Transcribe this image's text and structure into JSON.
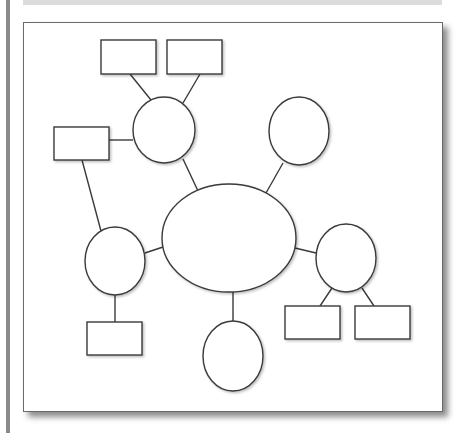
{
  "diagram": {
    "type": "mind-map",
    "colors": {
      "stroke": "#3a3a3a",
      "fill": "#ffffff",
      "frame_border": "#6a6a6a",
      "left_bar": "#8a8a8a",
      "top_band": "#dcdcdc"
    },
    "ellipses": [
      {
        "id": "center",
        "cx": 229,
        "cy": 238,
        "rx": 67,
        "ry": 54
      },
      {
        "id": "circle-top-left",
        "cx": 164,
        "cy": 130,
        "rx": 31,
        "ry": 33
      },
      {
        "id": "circle-top-right",
        "cx": 299,
        "cy": 131,
        "rx": 30,
        "ry": 34
      },
      {
        "id": "circle-left",
        "cx": 115,
        "cy": 261,
        "rx": 30,
        "ry": 34
      },
      {
        "id": "circle-right",
        "cx": 346,
        "cy": 258,
        "rx": 30,
        "ry": 34
      },
      {
        "id": "circle-bottom",
        "cx": 233,
        "cy": 356,
        "rx": 30,
        "ry": 35
      }
    ],
    "rects": [
      {
        "id": "box-top-1",
        "x": 101,
        "y": 40,
        "w": 55,
        "h": 34
      },
      {
        "id": "box-top-2",
        "x": 167,
        "y": 40,
        "w": 55,
        "h": 34
      },
      {
        "id": "box-left",
        "x": 54,
        "y": 127,
        "w": 55,
        "h": 33
      },
      {
        "id": "box-bottom-left",
        "x": 87,
        "y": 322,
        "w": 55,
        "h": 33
      },
      {
        "id": "box-bottom-right-1",
        "x": 285,
        "y": 306,
        "w": 55,
        "h": 33
      },
      {
        "id": "box-bottom-right-2",
        "x": 355,
        "y": 306,
        "w": 55,
        "h": 33
      }
    ],
    "lines": [
      {
        "from": "box-top-1",
        "to": "circle-top-left",
        "x1": 130,
        "y1": 74,
        "x2": 151,
        "y2": 100
      },
      {
        "from": "box-top-2",
        "to": "circle-top-left",
        "x1": 200,
        "y1": 74,
        "x2": 183,
        "y2": 103
      },
      {
        "from": "box-left",
        "to": "circle-top-left",
        "x1": 109,
        "y1": 140,
        "x2": 133,
        "y2": 140
      },
      {
        "from": "circle-top-left",
        "to": "center",
        "x1": 183,
        "y1": 159,
        "x2": 198,
        "y2": 191
      },
      {
        "from": "circle-top-right",
        "to": "center",
        "x1": 283,
        "y1": 163,
        "x2": 266,
        "y2": 193
      },
      {
        "from": "box-left",
        "to": "circle-left",
        "x1": 82,
        "y1": 160,
        "x2": 101,
        "y2": 231
      },
      {
        "from": "circle-left",
        "to": "center",
        "x1": 145,
        "y1": 253,
        "x2": 163,
        "y2": 247
      },
      {
        "from": "center",
        "to": "circle-right",
        "x1": 295,
        "y1": 248,
        "x2": 316,
        "y2": 253
      },
      {
        "from": "circle-left",
        "to": "box-bottom-left",
        "x1": 115,
        "y1": 295,
        "x2": 115,
        "y2": 322
      },
      {
        "from": "center",
        "to": "circle-bottom",
        "x1": 233,
        "y1": 292,
        "x2": 233,
        "y2": 321
      },
      {
        "from": "circle-right",
        "to": "box-bottom-right-1",
        "x1": 332,
        "y1": 288,
        "x2": 320,
        "y2": 306
      },
      {
        "from": "circle-right",
        "to": "box-bottom-right-2",
        "x1": 362,
        "y1": 288,
        "x2": 374,
        "y2": 306
      }
    ]
  }
}
